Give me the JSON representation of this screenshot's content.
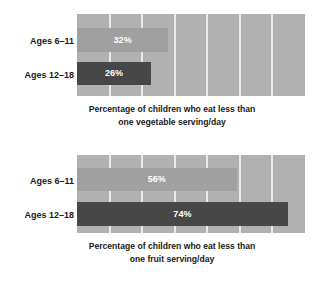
{
  "chart_data": [
    {
      "type": "bar",
      "id": "vegetable",
      "orientation": "horizontal",
      "title": "",
      "caption_line1": "Percentage of children who eat less than",
      "caption_line2": "one vegetable serving/day",
      "categories": [
        "Ages 6–11",
        "Ages 12–18"
      ],
      "values": [
        32,
        26
      ],
      "value_labels": [
        "32%",
        "26%"
      ],
      "bar_colors": [
        "#a0a0a0",
        "#474747"
      ],
      "xlabel": "",
      "ylabel": "",
      "xlim": [
        0,
        80
      ],
      "grid": true,
      "gridline_count": 6,
      "gridline_color": "#e9e9e9",
      "plot_background": "#b1b1b1",
      "legend": "none"
    },
    {
      "type": "bar",
      "id": "fruit",
      "orientation": "horizontal",
      "title": "",
      "caption_line1": "Percentage of children who eat less than",
      "caption_line2": "one fruit serving/day",
      "categories": [
        "Ages 6–11",
        "Ages 12–18"
      ],
      "values": [
        56,
        74
      ],
      "value_labels": [
        "56%",
        "74%"
      ],
      "bar_colors": [
        "#a0a0a0",
        "#474747"
      ],
      "xlabel": "",
      "ylabel": "",
      "xlim": [
        0,
        80
      ],
      "grid": true,
      "gridline_count": 6,
      "gridline_color": "#e9e9e9",
      "plot_background": "#b1b1b1",
      "legend": "none"
    }
  ]
}
